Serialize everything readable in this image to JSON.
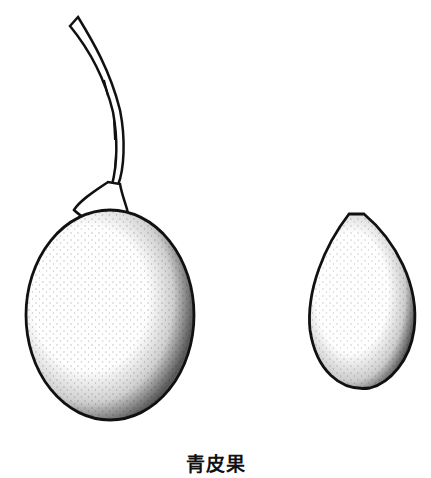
{
  "illustration": {
    "subject": "青皮果",
    "caption": "青皮果",
    "items": [
      {
        "name": "fruit-with-stem",
        "label": "whole fruit with stalk"
      },
      {
        "name": "fruit-small",
        "label": "small fruit"
      }
    ],
    "colors": {
      "ink": "#111111",
      "background": "#ffffff"
    }
  }
}
